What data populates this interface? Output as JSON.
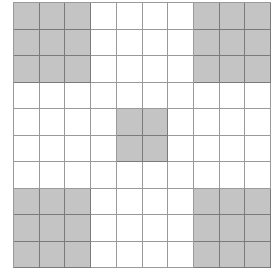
{
  "grid": {
    "rows": 10,
    "cols": 10,
    "fill_color": "#c4c4c4",
    "line_color": "#9a9a9a",
    "shaded_blocks": [
      {
        "name": "top-left",
        "row": 0,
        "col": 0,
        "rows": 3,
        "cols": 3
      },
      {
        "name": "top-right",
        "row": 0,
        "col": 7,
        "rows": 3,
        "cols": 3
      },
      {
        "name": "center",
        "row": 4,
        "col": 4,
        "rows": 2,
        "cols": 2
      },
      {
        "name": "bottom-left",
        "row": 7,
        "col": 0,
        "rows": 3,
        "cols": 3
      },
      {
        "name": "bottom-right",
        "row": 7,
        "col": 7,
        "rows": 3,
        "cols": 3
      }
    ]
  }
}
